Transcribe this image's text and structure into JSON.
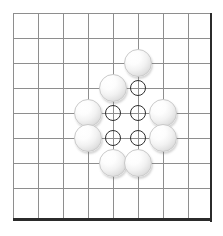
{
  "figure": {
    "width": 223,
    "height": 236
  },
  "board": {
    "grid_origin_x": 13,
    "grid_origin_y": 13,
    "grid_spacing": 25,
    "vertical_lines_x": [
      13,
      38,
      63,
      88,
      113,
      138,
      163,
      188
    ],
    "horizontal_lines_y": [
      13,
      38,
      63,
      88,
      113,
      138,
      163,
      188
    ],
    "grid_top": 13,
    "grid_bottom": 219,
    "grid_left": 13,
    "grid_right": 211,
    "line_color": "#8e8e8e",
    "edge_color": "#2b2b2b",
    "background_color": "#ffffff",
    "edges": [
      {
        "name": "right-edge",
        "x": 210,
        "y": 13,
        "length": 209,
        "orientation": "vertical"
      },
      {
        "name": "bottom-edge",
        "x": 13,
        "y": 218,
        "length": 199,
        "orientation": "horizontal"
      }
    ]
  },
  "stones": {
    "color": "white",
    "radius": 14,
    "count": 10,
    "items": [
      {
        "id": "stone-1",
        "color": "white",
        "cx": 138,
        "cy": 63
      },
      {
        "id": "stone-2",
        "color": "white",
        "cx": 113,
        "cy": 88
      },
      {
        "id": "stone-3",
        "color": "white",
        "cx": 88,
        "cy": 113
      },
      {
        "id": "stone-4",
        "color": "white",
        "cx": 163,
        "cy": 113
      },
      {
        "id": "stone-5",
        "color": "white",
        "cx": 88,
        "cy": 138
      },
      {
        "id": "stone-6",
        "color": "white",
        "cx": 163,
        "cy": 138
      },
      {
        "id": "stone-7",
        "color": "white",
        "cx": 113,
        "cy": 163
      },
      {
        "id": "stone-8",
        "color": "white",
        "cx": 138,
        "cy": 163
      }
    ]
  },
  "markers": {
    "shape": "circle",
    "color": "#2e2e2e",
    "radius": 8,
    "count": 5,
    "items": [
      {
        "id": "marker-1",
        "cx": 138,
        "cy": 88
      },
      {
        "id": "marker-2",
        "cx": 113,
        "cy": 113
      },
      {
        "id": "marker-3",
        "cx": 138,
        "cy": 113
      },
      {
        "id": "marker-4",
        "cx": 113,
        "cy": 138
      },
      {
        "id": "marker-5",
        "cx": 138,
        "cy": 138
      }
    ]
  }
}
